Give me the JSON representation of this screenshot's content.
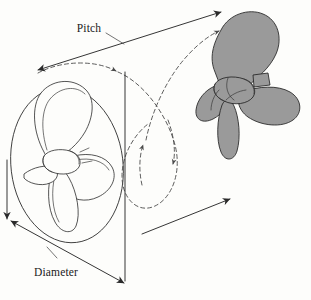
{
  "figure": {
    "kind": "technical-line-diagram",
    "background_color": "#fdfdfb",
    "ink_color": "#2a2a2a",
    "blade_fill_color": "#9a9a9a",
    "width": 311,
    "height": 300
  },
  "labels": {
    "pitch": "Pitch",
    "diameter": "Diameter"
  },
  "annotations": {
    "pitch_leader": "leader-line-from-pitch-label-to-pitch-arrow",
    "diameter_leader": "leader-line-from-diameter-label-to-diameter-arrow",
    "pitch_measure": "double-headed-arrow-advance-per-revolution",
    "diameter_measure": "double-headed-arrow-across-swept-circle",
    "advance_arrow": "solid-arrow-direction-of-travel",
    "rotation_path": "dashed-helical-path-one-revolution"
  },
  "elements": {
    "propeller_outline": "propeller-outline-start-position",
    "propeller_solid": "propeller-shaded-end-position",
    "swept_circle": "swept-disc-ellipse",
    "hub_outline": "hub-outline",
    "hub_solid": "hub-shaded"
  },
  "icons": {
    "arrowhead": "arrowhead-icon",
    "dashed_curve": "dashed-curve-icon"
  }
}
